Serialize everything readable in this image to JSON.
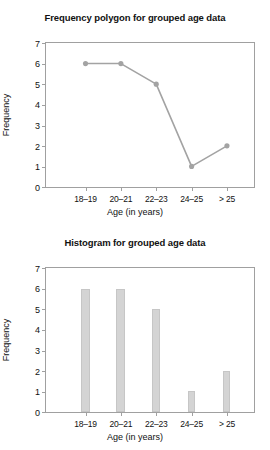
{
  "page": {
    "background_color": "#ffffff",
    "accent_color": "#a3a3a3",
    "bar_fill_color": "#d4d4d4",
    "axis_color": "#a0a0a0"
  },
  "charts": [
    {
      "id": "frequency-polygon",
      "title": "Frequency polygon for grouped age data",
      "xlabel": "Age (in years)",
      "ylabel": "Frequency",
      "yticks": [
        "7",
        "6",
        "5",
        "4",
        "3",
        "2",
        "1",
        "0"
      ],
      "xticks": [
        "18–19",
        "20–21",
        "22–23",
        "24–25",
        "> 25"
      ]
    },
    {
      "id": "histogram",
      "title": "Histogram for grouped age data",
      "xlabel": "Age (in years)",
      "ylabel": "Frequency",
      "yticks": [
        "7",
        "6",
        "5",
        "4",
        "3",
        "2",
        "1",
        "0"
      ],
      "xticks": [
        "18–19",
        "20–21",
        "22–23",
        "24–25",
        "> 25"
      ]
    }
  ],
  "chart_data": [
    {
      "type": "line",
      "title": "Frequency polygon for grouped age data",
      "xlabel": "Age (in years)",
      "ylabel": "Frequency",
      "categories": [
        "18–19",
        "20–21",
        "22–23",
        "24–25",
        "> 25"
      ],
      "values": [
        6,
        6,
        5,
        1,
        2
      ],
      "ylim": [
        0,
        7
      ],
      "yticks": [
        0,
        1,
        2,
        3,
        4,
        5,
        6,
        7
      ],
      "grid": false,
      "legend": "none",
      "series_color": "#a3a3a3",
      "marker": "circle"
    },
    {
      "type": "bar",
      "title": "Histogram for grouped age data",
      "xlabel": "Age (in years)",
      "ylabel": "Frequency",
      "categories": [
        "18–19",
        "20–21",
        "22–23",
        "24–25",
        "> 25"
      ],
      "values": [
        6,
        6,
        5,
        1,
        2
      ],
      "ylim": [
        0,
        7
      ],
      "yticks": [
        0,
        1,
        2,
        3,
        4,
        5,
        6,
        7
      ],
      "grid": false,
      "legend": "none",
      "bar_color": "#d4d4d4"
    }
  ]
}
